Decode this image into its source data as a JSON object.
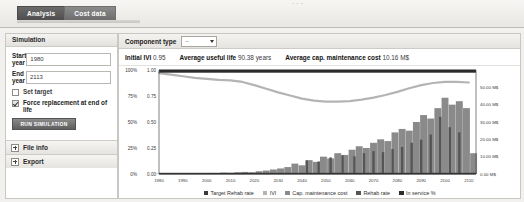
{
  "window": {
    "tabs": [
      {
        "label": "Analysis",
        "active": true
      },
      {
        "label": "Cost data",
        "active": false
      }
    ]
  },
  "sidebar": {
    "title": "Simulation",
    "fields": [
      {
        "label": "Start year",
        "value": "1980",
        "placeholder": "1980"
      },
      {
        "label": "End year",
        "value": "2113",
        "placeholder": "2113"
      }
    ],
    "checkboxes": [
      {
        "label": "Set target",
        "checked": false
      },
      {
        "label": "Force replacement at end of life",
        "checked": true
      }
    ],
    "run_button": "RUN SIMULATION",
    "accordions": [
      {
        "label": "File info"
      },
      {
        "label": "Export"
      }
    ]
  },
  "main": {
    "component_type_label": "Component type",
    "component_type_value": "--",
    "stats": [
      {
        "label": "Initial IVI",
        "value": "0.95"
      },
      {
        "label": "Average useful life",
        "value": "90.38 years"
      },
      {
        "label": "Average cap. maintenance cost",
        "value": "10.16 M$"
      }
    ]
  },
  "chart_data": {
    "type": "bar",
    "title": "",
    "xlabel": "",
    "ylabel": "",
    "x_ticks": [
      "1980",
      "1990",
      "2000",
      "2010",
      "2020",
      "2030",
      "2040",
      "2050",
      "2060",
      "2070",
      "2080",
      "2090",
      "2100",
      "2110"
    ],
    "xlim": [
      1980,
      2113
    ],
    "left_axis": {
      "percent_ticks": [
        "100%",
        "75%",
        "50%",
        "25%",
        "0%"
      ],
      "ratio_ticks": [
        "1.00",
        "0.75",
        "0.50",
        "0.25",
        "0.00"
      ],
      "ylim": [
        0,
        1
      ]
    },
    "right_axis": {
      "ticks": [
        "50.00 M$",
        "40.00 M$",
        "30.00 M$",
        "20.00 M$",
        "10.00 M$",
        "0.00 M$"
      ],
      "ylim": [
        0,
        60
      ]
    },
    "grid": false,
    "legend_position": "bottom",
    "legend": [
      {
        "name": "Target Rehab rate",
        "color": "#3a3a3a"
      },
      {
        "name": "IVI",
        "color": "#b4b4b4"
      },
      {
        "name": "Cap. maintenance cost",
        "color": "#8a8a8a"
      },
      {
        "name": "Rehab rate",
        "color": "#555555"
      },
      {
        "name": "In service %",
        "color": "#2b2b2b"
      }
    ],
    "series": [
      {
        "name": "In service %",
        "type": "line",
        "axis": "left",
        "color": "#2b2b2b",
        "x": [
          1980,
          1990,
          2000,
          2010,
          2020,
          2030,
          2040,
          2050,
          2060,
          2070,
          2080,
          2090,
          2100,
          2110
        ],
        "values": [
          1.0,
          1.0,
          1.0,
          1.0,
          1.0,
          1.0,
          1.0,
          1.0,
          1.0,
          1.0,
          1.0,
          1.0,
          1.0,
          1.0
        ]
      },
      {
        "name": "IVI",
        "type": "line",
        "axis": "left",
        "color": "#b4b4b4",
        "x": [
          1980,
          1985,
          1990,
          1995,
          2000,
          2005,
          2010,
          2015,
          2020,
          2025,
          2030,
          2035,
          2040,
          2045,
          2050,
          2055,
          2060,
          2065,
          2070,
          2075,
          2080,
          2085,
          2090,
          2095,
          2100,
          2105,
          2110
        ],
        "values": [
          0.97,
          0.955,
          0.94,
          0.925,
          0.915,
          0.905,
          0.9,
          0.885,
          0.855,
          0.82,
          0.785,
          0.755,
          0.725,
          0.705,
          0.695,
          0.695,
          0.7,
          0.715,
          0.735,
          0.76,
          0.79,
          0.825,
          0.855,
          0.875,
          0.885,
          0.885,
          0.88
        ]
      },
      {
        "name": "Cap. maintenance cost",
        "type": "bar",
        "axis": "right",
        "color": "#8a8a8a",
        "x": [
          1980,
          1983,
          1986,
          1989,
          1992,
          1995,
          1998,
          2001,
          2004,
          2007,
          2010,
          2013,
          2016,
          2019,
          2022,
          2025,
          2028,
          2031,
          2034,
          2037,
          2040,
          2043,
          2046,
          2049,
          2052,
          2055,
          2058,
          2061,
          2064,
          2067,
          2070,
          2073,
          2076,
          2079,
          2082,
          2085,
          2088,
          2091,
          2094,
          2097,
          2100,
          2103,
          2106,
          2109,
          2112
        ],
        "values": [
          0.2,
          0.3,
          0.2,
          0.4,
          0.3,
          0.5,
          0.4,
          0.6,
          0.5,
          0.8,
          0.7,
          1.0,
          1.2,
          1.0,
          1.6,
          2.0,
          2.6,
          3.2,
          4.0,
          6.0,
          5.0,
          8.0,
          7.0,
          10.0,
          9.0,
          12.0,
          11.0,
          14.0,
          16.0,
          15.0,
          18.0,
          20.0,
          19.0,
          24.0,
          26.0,
          25.0,
          30.0,
          34.0,
          32.0,
          38.0,
          44.0,
          40.0,
          42.0,
          38.0,
          12.0
        ]
      },
      {
        "name": "Rehab rate",
        "type": "bar",
        "axis": "left",
        "color": "#555555",
        "x": [
          2042,
          2047,
          2052,
          2057,
          2062,
          2066,
          2070,
          2074,
          2078,
          2082,
          2086,
          2090,
          2094,
          2098,
          2102,
          2106
        ],
        "values": [
          0.13,
          0.12,
          0.16,
          0.18,
          0.17,
          0.2,
          0.22,
          0.21,
          0.24,
          0.26,
          0.3,
          0.33,
          0.38,
          0.55,
          0.45,
          0.4
        ]
      },
      {
        "name": "Target Rehab rate",
        "type": "line",
        "axis": "left",
        "color": "#3a3a3a",
        "x": [
          1980,
          2110
        ],
        "values": [
          0.0,
          0.0
        ]
      }
    ]
  }
}
